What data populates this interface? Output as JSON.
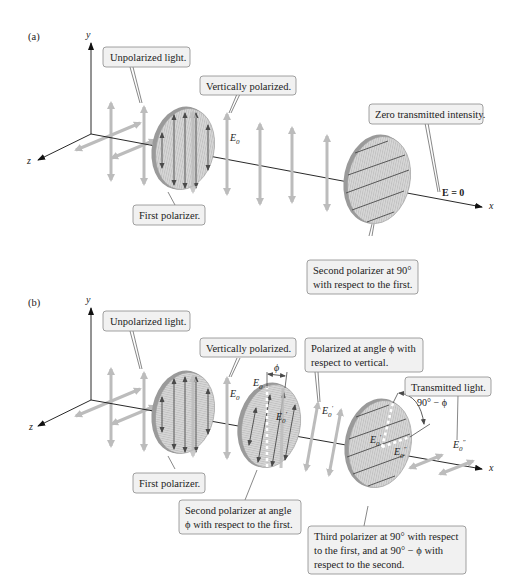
{
  "panels": {
    "a": {
      "tag": "(a)",
      "axes": {
        "y": "y",
        "z": "z",
        "x": "x"
      },
      "callouts": {
        "unpolarized": "Unpolarized light.",
        "vertical": "Vertically polarized.",
        "zero": "Zero transmitted intensity.",
        "first": "First polarizer.",
        "second_l1": "Second polarizer at 90°",
        "second_l2": "with respect to the first."
      },
      "math": {
        "e0": "E",
        "e0_sub": "0",
        "e_zero": "E = 0"
      }
    },
    "b": {
      "tag": "(b)",
      "axes": {
        "y": "y",
        "z": "z",
        "x": "x"
      },
      "callouts": {
        "unpolarized": "Unpolarized light.",
        "vertical": "Vertically polarized.",
        "angle_l1": "Polarized at angle ϕ with",
        "angle_l2": "respect to vertical.",
        "transmitted": "Transmitted light.",
        "first": "First polarizer.",
        "second_l1": "Second polarizer at angle",
        "second_l2": "ϕ with respect to the first.",
        "third_l1": "Third polarizer at 90° with respect",
        "third_l2": "to the first, and at 90° − ϕ with",
        "third_l3": "respect to the second."
      },
      "math": {
        "e0": "E",
        "sub0": "0",
        "prime": "′",
        "dprime": "″",
        "phi": "ϕ",
        "ninety_minus_phi": "90° − ϕ"
      }
    }
  }
}
